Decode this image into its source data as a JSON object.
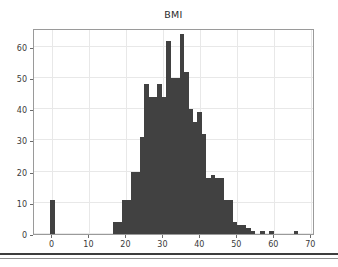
{
  "figure": {
    "title": "BMI",
    "background_color": "#ffffff",
    "bar_color": "#414141",
    "axes_color": "#9a9a9a",
    "grid_color": "#e8e8e8"
  },
  "chart_data": {
    "type": "bar",
    "title": "BMI",
    "xlabel": "",
    "ylabel": "",
    "xlim": [
      -5,
      71
    ],
    "ylim": [
      0,
      66
    ],
    "grid": true,
    "legend": null,
    "xticks": [
      0,
      10,
      20,
      30,
      40,
      50,
      60,
      70
    ],
    "xtick_labels": [
      "0",
      "10",
      "20",
      "30",
      "40",
      "50",
      "60",
      "70"
    ],
    "yticks": [
      0,
      10,
      20,
      30,
      40,
      50,
      60
    ],
    "ytick_labels": [
      "0",
      "10",
      "20",
      "30",
      "40",
      "50",
      "60"
    ],
    "bin_width": 1.2,
    "bins": [
      {
        "x": 0.0,
        "value": 11
      },
      {
        "x": 17.0,
        "value": 4
      },
      {
        "x": 18.2,
        "value": 4
      },
      {
        "x": 19.4,
        "value": 11
      },
      {
        "x": 20.6,
        "value": 11
      },
      {
        "x": 21.8,
        "value": 20
      },
      {
        "x": 23.0,
        "value": 20
      },
      {
        "x": 24.2,
        "value": 31
      },
      {
        "x": 25.4,
        "value": 48
      },
      {
        "x": 26.6,
        "value": 44
      },
      {
        "x": 27.8,
        "value": 44
      },
      {
        "x": 29.0,
        "value": 48
      },
      {
        "x": 30.2,
        "value": 44
      },
      {
        "x": 31.4,
        "value": 62
      },
      {
        "x": 32.6,
        "value": 50
      },
      {
        "x": 33.8,
        "value": 50
      },
      {
        "x": 35.0,
        "value": 64
      },
      {
        "x": 36.2,
        "value": 52
      },
      {
        "x": 37.4,
        "value": 40
      },
      {
        "x": 38.6,
        "value": 36
      },
      {
        "x": 39.8,
        "value": 39
      },
      {
        "x": 41.0,
        "value": 32
      },
      {
        "x": 42.2,
        "value": 18
      },
      {
        "x": 43.4,
        "value": 19
      },
      {
        "x": 44.6,
        "value": 18
      },
      {
        "x": 45.8,
        "value": 18
      },
      {
        "x": 47.0,
        "value": 11
      },
      {
        "x": 48.2,
        "value": 11
      },
      {
        "x": 49.4,
        "value": 4
      },
      {
        "x": 50.6,
        "value": 3
      },
      {
        "x": 51.8,
        "value": 3
      },
      {
        "x": 53.0,
        "value": 2
      },
      {
        "x": 54.2,
        "value": 1
      },
      {
        "x": 56.8,
        "value": 1
      },
      {
        "x": 59.2,
        "value": 1
      },
      {
        "x": 65.8,
        "value": 1
      }
    ]
  }
}
